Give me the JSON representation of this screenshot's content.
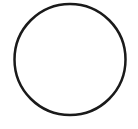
{
  "diagram": {
    "shapes": [
      {
        "type": "circle",
        "cx": 70,
        "cy": 59.5,
        "r": 55.5,
        "stroke": "#1a1a1a",
        "stroke_width": 2.5,
        "fill": "#ffffff"
      }
    ],
    "background": "#ffffff"
  }
}
